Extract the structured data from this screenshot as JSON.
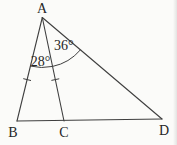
{
  "figure": {
    "background_color": "#fbfbf9",
    "stroke_color": "#3f3f3f",
    "label_color": "#262626",
    "points": {
      "A": {
        "x": 42.3,
        "y": 17.5
      },
      "B": {
        "x": 17.0,
        "y": 121.0
      },
      "C": {
        "x": 64.0,
        "y": 121.0
      },
      "D": {
        "x": 162.0,
        "y": 119.0
      }
    },
    "segments": [
      {
        "from": "A",
        "to": "B"
      },
      {
        "from": "A",
        "to": "C"
      },
      {
        "from": "A",
        "to": "D"
      },
      {
        "from": "B",
        "to": "D"
      }
    ],
    "vertex_labels": [
      {
        "text": "A",
        "x": 42,
        "y": 13
      },
      {
        "text": "B",
        "x": 13,
        "y": 136.5
      },
      {
        "text": "C",
        "x": 64,
        "y": 136.5
      },
      {
        "text": "D",
        "x": 164,
        "y": 135
      }
    ],
    "angle_marks": [
      {
        "text": "28°",
        "vertex": "A",
        "from": "B",
        "to": "C",
        "radius": 50,
        "label_x": 40.5,
        "label_y": 66
      },
      {
        "text": "36°",
        "vertex": "A",
        "from": "C",
        "to": "D",
        "radius": 50,
        "label_x": 63.8,
        "label_y": 50
      }
    ],
    "tick_marks": [
      {
        "from": "A",
        "to": "B",
        "t": 0.6,
        "half_length": 4
      },
      {
        "from": "A",
        "to": "C",
        "t": 0.6,
        "half_length": 4
      }
    ]
  }
}
